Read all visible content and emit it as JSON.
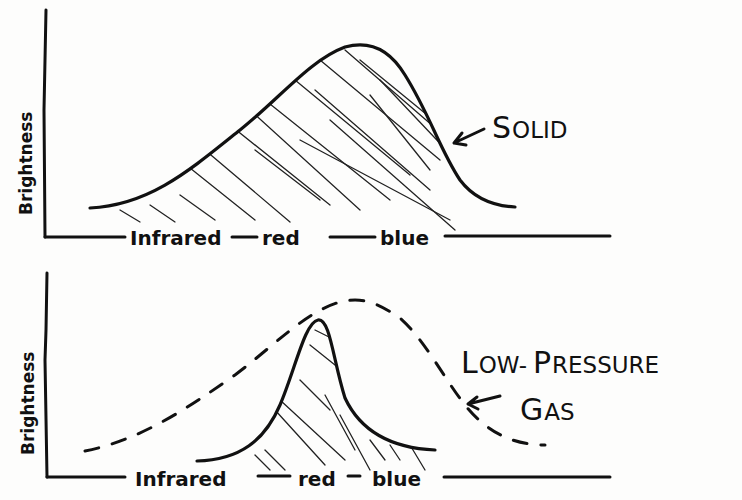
{
  "diagram": {
    "style": "hand-drawn black ink on white",
    "colors": {
      "ink": "#111111",
      "background": "#fdfdfc"
    },
    "panels": [
      {
        "id": "solid",
        "y_axis_label": "Brightness",
        "x_axis_labels": [
          "Infrared",
          "red",
          "blue"
        ],
        "callout": {
          "label_first": "S",
          "label_rest": "OLID",
          "full": "SOLID"
        },
        "curves": [
          {
            "name": "continuous-spectrum",
            "style": "solid",
            "hatched": true,
            "shape": "broad hump, peak slightly right of center (between red and blue)"
          }
        ]
      },
      {
        "id": "low-pressure-gas",
        "y_axis_label": "Brightness",
        "x_axis_labels": [
          "Infrared",
          "red",
          "blue"
        ],
        "callout": {
          "line1_first": "L",
          "line1_rest": "OW-",
          "line1b_first": "P",
          "line1b_rest": "RESSURE",
          "line2_first": "G",
          "line2_rest": "AS",
          "full": "LOW-PRESSURE GAS"
        },
        "curves": [
          {
            "name": "reference-continuous",
            "style": "dashed",
            "hatched": false,
            "shape": "broad hump like the solid"
          },
          {
            "name": "emission-line",
            "style": "solid",
            "hatched": true,
            "shape": "narrow sharp peak near red"
          }
        ]
      }
    ]
  }
}
